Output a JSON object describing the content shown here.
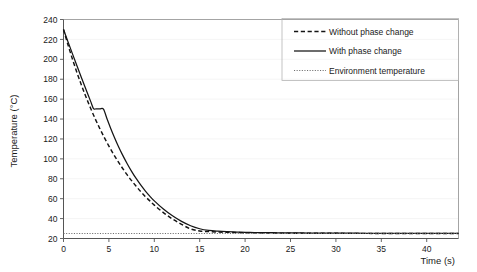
{
  "chart_data": {
    "type": "line",
    "title": "",
    "xlabel": "Time (s)",
    "ylabel": "Temperature (°C)",
    "xlim": [
      0,
      43.5
    ],
    "ylim": [
      20,
      240
    ],
    "xticks": [
      0,
      5,
      10,
      15,
      20,
      25,
      30,
      35,
      40
    ],
    "yticks": [
      20,
      40,
      60,
      80,
      100,
      120,
      140,
      160,
      180,
      200,
      220,
      240
    ],
    "xtick_labels": [
      "0",
      "5",
      "10",
      "15",
      "20",
      "25",
      "30",
      "35",
      "40"
    ],
    "ytick_labels": [
      "20",
      "40",
      "60",
      "80",
      "100",
      "120",
      "140",
      "160",
      "180",
      "200",
      "220",
      "240"
    ],
    "grid": true,
    "grid_axis": "y",
    "legend_position": "top-right",
    "environment_temperature": 25,
    "initial_temperature": 230,
    "phase_change_plateau_temperature": 150,
    "phase_change_plateau_start_time": 3.3,
    "phase_change_plateau_end_time": 4.4,
    "series": [
      {
        "name": "Without phase change",
        "style": "dashed",
        "color": "#141414",
        "x": [
          0,
          0.5,
          1,
          1.5,
          2,
          2.5,
          3,
          3.5,
          4,
          4.5,
          5,
          5.5,
          6,
          6.5,
          7,
          7.5,
          8,
          8.5,
          9,
          9.5,
          10,
          11,
          12,
          13,
          14,
          15,
          16,
          17,
          18,
          19,
          20,
          21,
          22,
          23,
          24,
          25,
          26,
          27,
          28,
          29,
          30,
          31,
          32,
          33,
          34,
          35,
          36,
          37,
          38,
          39,
          40,
          41,
          42,
          43,
          43.5
        ],
        "y": [
          230,
          214.4,
          199.8,
          186.2,
          173.5,
          161.6,
          150.5,
          140.1,
          130.4,
          121.3,
          112.8,
          104.9,
          97.5,
          90.6,
          84.1,
          78.1,
          72.5,
          67.2,
          62.3,
          57.8,
          53.5,
          46.0,
          39.6,
          34.2,
          29.6,
          27.6,
          26.9,
          26.5,
          26.2,
          26.0,
          25.8,
          25.7,
          25.6,
          25.5,
          25.4,
          25.35,
          25.3,
          25.27,
          25.24,
          25.21,
          25.19,
          25.17,
          25.15,
          25.13,
          25.12,
          25.11,
          25.1,
          25.09,
          25.08,
          25.07,
          25.06,
          25.05,
          25.05,
          25.04,
          25.04
        ]
      },
      {
        "name": "With phase change",
        "style": "solid",
        "color": "#141414",
        "x": [
          0,
          0.5,
          1,
          1.5,
          2,
          2.5,
          3,
          3.3,
          3.6,
          4,
          4.4,
          4.8,
          5.2,
          5.6,
          6,
          6.5,
          7,
          7.5,
          8,
          8.5,
          9,
          9.5,
          10,
          11,
          12,
          13,
          14,
          15,
          16,
          17,
          18,
          19,
          20,
          21,
          22,
          23,
          24,
          25,
          26,
          27,
          28,
          29,
          30,
          31,
          32,
          33,
          34,
          35,
          36,
          37,
          38,
          39,
          40,
          41,
          42,
          43,
          43.5
        ],
        "y": [
          230,
          217.5,
          205.2,
          193.0,
          181.0,
          169.2,
          157.5,
          150.5,
          150.3,
          150.2,
          150.0,
          140.0,
          130.6,
          121.8,
          113.5,
          104.0,
          95.4,
          87.5,
          80.3,
          73.8,
          67.9,
          62.6,
          57.8,
          49.6,
          42.8,
          37.2,
          32.8,
          29.8,
          28.1,
          27.3,
          26.8,
          26.5,
          26.2,
          26.0,
          25.9,
          25.8,
          25.7,
          25.6,
          25.55,
          25.5,
          25.45,
          25.4,
          25.36,
          25.33,
          25.3,
          25.27,
          25.25,
          25.22,
          25.2,
          25.18,
          25.16,
          25.14,
          25.13,
          25.12,
          25.11,
          25.1,
          25.1
        ]
      },
      {
        "name": "Environment temperature",
        "style": "dotted",
        "color": "#6f6f6f",
        "x": [
          0,
          43.5
        ],
        "y": [
          25,
          25
        ]
      }
    ]
  },
  "legend": {
    "items": [
      {
        "label": "Without phase change",
        "style": "dashed"
      },
      {
        "label": "With phase change",
        "style": "solid"
      },
      {
        "label": "Environment temperature",
        "style": "dotted"
      }
    ]
  }
}
